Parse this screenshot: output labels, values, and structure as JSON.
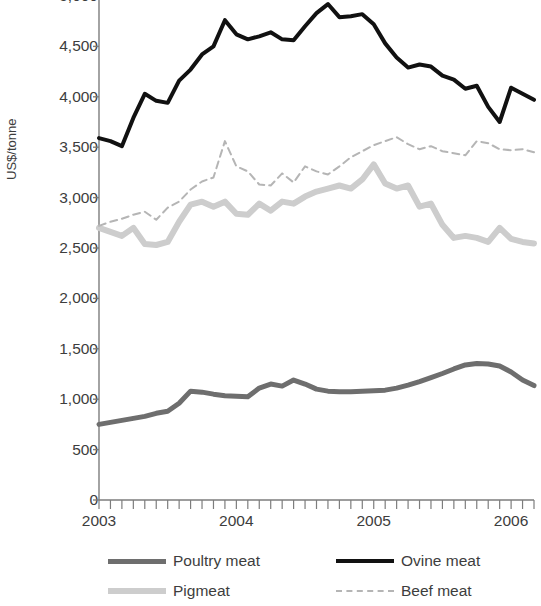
{
  "chart_data": {
    "type": "line",
    "title": "",
    "subtitle": "",
    "xlabel": "",
    "ylabel": "US$/tonne",
    "ylim": [
      0,
      5000
    ],
    "ytick_values": [
      0,
      500,
      1000,
      1500,
      2000,
      2500,
      3000,
      3500,
      4000,
      4500,
      5000
    ],
    "ytick_labels": [
      "0",
      "500",
      "1,000",
      "1,500",
      "2,000",
      "2,500",
      "3,000",
      "3,500",
      "4,000",
      "4,500",
      "5,000"
    ],
    "xlim": [
      "2003-01",
      "2006-03"
    ],
    "xtick_labels": [
      "2003",
      "2004",
      "2005",
      "2006"
    ],
    "xtick_positions": [
      0,
      12,
      24,
      36
    ],
    "x_minor_ticks": "monthly",
    "grid": false,
    "legend_position": "below",
    "x": [
      "2003-01",
      "2003-02",
      "2003-03",
      "2003-04",
      "2003-05",
      "2003-06",
      "2003-07",
      "2003-08",
      "2003-09",
      "2003-10",
      "2003-11",
      "2003-12",
      "2004-01",
      "2004-02",
      "2004-03",
      "2004-04",
      "2004-05",
      "2004-06",
      "2004-07",
      "2004-08",
      "2004-09",
      "2004-10",
      "2004-11",
      "2004-12",
      "2005-01",
      "2005-02",
      "2005-03",
      "2005-04",
      "2005-05",
      "2005-06",
      "2005-07",
      "2005-08",
      "2005-09",
      "2005-10",
      "2005-11",
      "2005-12",
      "2006-01",
      "2006-02",
      "2006-03"
    ],
    "series": [
      {
        "name": "Poultry meat",
        "color": "#6e6e6e",
        "style": "solid",
        "width": 5,
        "values": [
          750,
          770,
          790,
          810,
          830,
          860,
          880,
          960,
          1080,
          1070,
          1050,
          1035,
          1030,
          1025,
          1110,
          1150,
          1130,
          1190,
          1150,
          1100,
          1080,
          1075,
          1075,
          1080,
          1085,
          1090,
          1110,
          1140,
          1175,
          1215,
          1255,
          1300,
          1340,
          1355,
          1350,
          1330,
          1270,
          1190,
          1135
        ]
      },
      {
        "name": "Pigmeat",
        "color": "#cdcdcd",
        "style": "solid",
        "width": 6,
        "values": [
          2700,
          2660,
          2620,
          2700,
          2540,
          2530,
          2560,
          2760,
          2930,
          2960,
          2910,
          2960,
          2840,
          2830,
          2940,
          2870,
          2960,
          2940,
          3010,
          3060,
          3090,
          3120,
          3090,
          3180,
          3330,
          3140,
          3090,
          3120,
          2910,
          2940,
          2730,
          2600,
          2620,
          2600,
          2560,
          2700,
          2590,
          2560,
          2545
        ]
      },
      {
        "name": "Ovine meat",
        "color": "#111111",
        "style": "solid",
        "width": 4,
        "values": [
          3590,
          3560,
          3510,
          3790,
          4030,
          3960,
          3940,
          4160,
          4270,
          4420,
          4500,
          4760,
          4620,
          4570,
          4600,
          4640,
          4570,
          4560,
          4700,
          4830,
          4920,
          4790,
          4800,
          4820,
          4720,
          4530,
          4390,
          4290,
          4320,
          4300,
          4210,
          4170,
          4080,
          4110,
          3900,
          3750,
          4090,
          4030,
          3970
        ]
      },
      {
        "name": "Beef meat",
        "color": "#b5b5b5",
        "style": "dashed",
        "width": 2,
        "values": [
          2720,
          2760,
          2790,
          2830,
          2860,
          2780,
          2900,
          2960,
          3080,
          3160,
          3200,
          3560,
          3310,
          3260,
          3130,
          3120,
          3240,
          3150,
          3310,
          3260,
          3230,
          3310,
          3400,
          3460,
          3520,
          3560,
          3600,
          3530,
          3480,
          3510,
          3460,
          3440,
          3420,
          3560,
          3540,
          3480,
          3470,
          3480,
          3450
        ]
      }
    ]
  },
  "legend": {
    "entries": [
      {
        "label": "Poultry meat"
      },
      {
        "label": "Ovine meat"
      },
      {
        "label": "Pigmeat"
      },
      {
        "label": "Beef meat"
      }
    ]
  }
}
